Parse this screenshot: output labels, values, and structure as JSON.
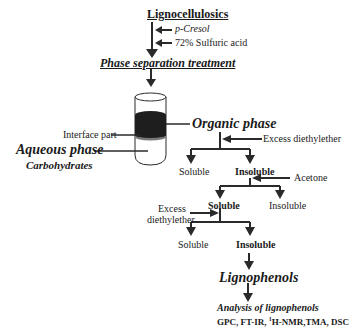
{
  "diagram": {
    "title": "Lignocellulosics",
    "reagents": [
      "p-Cresol",
      "72% Sulfuric acid"
    ],
    "step1": "Phase separation treatment",
    "tube_labels": {
      "interface": "Interface part",
      "organic": "Organic phase",
      "aqueous": "Aqueous phase",
      "aqueous_sub": "Carbohydrates"
    },
    "branch1": {
      "reagent": "Excess diethylether",
      "left": "Soluble",
      "right": "Insoluble"
    },
    "branch2": {
      "reagent": "Acetone",
      "left": "Soluble",
      "right": "Insoluble"
    },
    "branch3": {
      "reagent_line1": "Excess",
      "reagent_line2": "diethylether",
      "left": "Soluble",
      "right": "Insoluble"
    },
    "product": "Lignophenols",
    "analysis_title": "Analysis of lignophenols",
    "analysis_methods_pre": "GPC, FT-IR, ",
    "analysis_methods_sup": "1",
    "analysis_methods_post": "H-NMR,TMA, DSC"
  },
  "colors": {
    "line": "#2a2a2a",
    "phase_dark": "#1e1e1e"
  }
}
